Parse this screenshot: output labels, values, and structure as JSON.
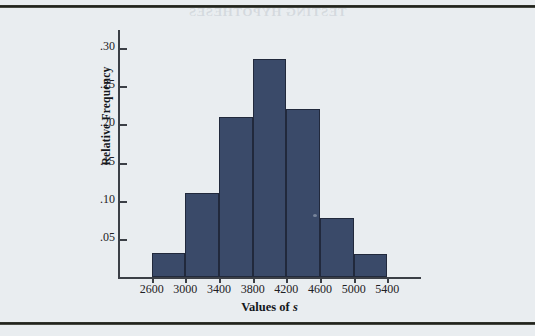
{
  "figure": {
    "background_color": "#e9edf0",
    "bar_color": "#3a4a69",
    "axis_color": "#3b3f46",
    "ghost_text": "TESTING HYPOTHESES"
  },
  "chart_data": {
    "type": "bar",
    "title": "",
    "subtitle": "",
    "xlabel": "Values of s",
    "xlabel_parts": {
      "prefix": "Values of ",
      "variable": "s"
    },
    "ylabel": "Relative Frequency",
    "categories": [
      "2600-3000",
      "3000-3400",
      "3400-3800",
      "3800-4200",
      "4200-4600",
      "4600-5000",
      "5000-5400"
    ],
    "bin_edges": [
      2600,
      3000,
      3400,
      3800,
      4200,
      4600,
      5000,
      5400
    ],
    "values": [
      0.031,
      0.11,
      0.21,
      0.285,
      0.22,
      0.077,
      0.03
    ],
    "bin_width": 400,
    "xlim": [
      2200,
      5800
    ],
    "ylim": [
      0,
      0.32
    ],
    "xticks": [
      2600,
      3000,
      3400,
      3800,
      4200,
      4600,
      5000,
      5400
    ],
    "xtick_labels": [
      "2600",
      "3000",
      "3400",
      "3800",
      "4200",
      "4600",
      "5000",
      "5400"
    ],
    "yticks": [
      0.05,
      0.1,
      0.15,
      0.2,
      0.25,
      0.3
    ],
    "ytick_labels": [
      ".05",
      ".10",
      ".15",
      ".20",
      ".25",
      ".30"
    ],
    "grid": false,
    "legend": null,
    "legend_position": "none",
    "annotations": []
  }
}
